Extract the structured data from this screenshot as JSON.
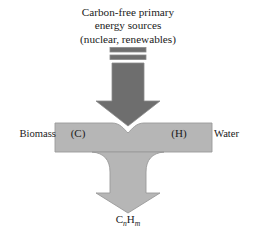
{
  "figure": {
    "title_lines": [
      "Carbon-free primary",
      "energy sources",
      "(nuclear, renewables)"
    ],
    "left_label": "Biomass",
    "right_label": "Water",
    "inner_left_label": "(C)",
    "inner_right_label": "(H)",
    "product": {
      "element_c": "C",
      "sub_n": "n",
      "element_h": "H",
      "sub_m": "m"
    },
    "colors": {
      "dark_gray": "#6e6e6e",
      "light_gray": "#b6b6b6",
      "outline": "#8c8c8c",
      "background": "#ffffff",
      "text": "#1a1a1a"
    }
  }
}
